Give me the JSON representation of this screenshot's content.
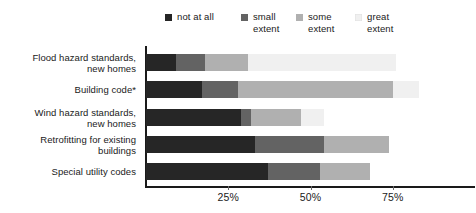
{
  "legend": {
    "position": "top",
    "items": [
      {
        "label": "not at all",
        "color": "#262626"
      },
      {
        "label": "small\nextent",
        "color": "#636363"
      },
      {
        "label": "some\nextent",
        "color": "#b0b0b0"
      },
      {
        "label": "great\nextent",
        "color": "#f0f0f0"
      }
    ]
  },
  "axis": {
    "ticks": [
      {
        "label": "25%",
        "value": 25
      },
      {
        "label": "50%",
        "value": 50
      },
      {
        "label": "75%",
        "value": 75
      }
    ],
    "xlim": [
      0,
      101
    ]
  },
  "chart_data": {
    "type": "bar",
    "title": "",
    "subtitle": "",
    "xlabel": "",
    "ylabel": "",
    "orientation": "horizontal",
    "stacked": true,
    "grid": false,
    "legend_position": "top",
    "xlim": [
      0,
      101
    ],
    "xtick_labels": [
      "25%",
      "50%",
      "75%"
    ],
    "xtick_values": [
      25,
      50,
      75
    ],
    "categories": [
      "Flood hazard standards,\nnew homes",
      "Building code*",
      "Wind hazard standards,\nnew homes",
      "Retrofitting for existing\nbuildings",
      "Special utility codes"
    ],
    "series": [
      {
        "name": "not at all",
        "color": "#262626",
        "values": [
          9,
          17,
          29,
          33,
          37
        ]
      },
      {
        "name": "small extent",
        "color": "#636363",
        "values": [
          9,
          11,
          3,
          21,
          16
        ]
      },
      {
        "name": "some extent",
        "color": "#b0b0b0",
        "values": [
          13,
          47,
          15,
          20,
          15
        ]
      },
      {
        "name": "great extent",
        "color": "#f0f0f0",
        "values": [
          45,
          8,
          7,
          0,
          0
        ]
      }
    ]
  },
  "caption": ""
}
